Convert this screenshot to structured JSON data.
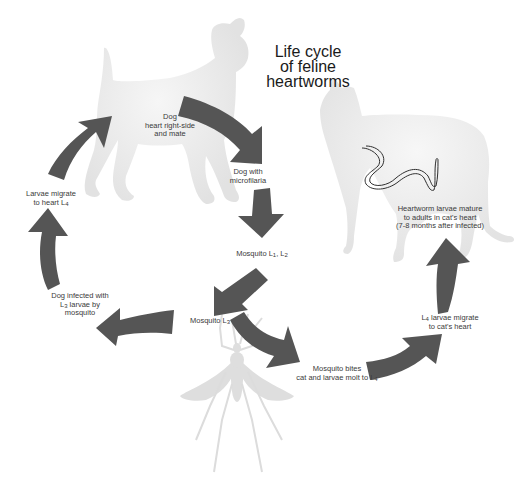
{
  "title": {
    "line1": "Life cycle",
    "line2": "of feline",
    "line3": "heartworms"
  },
  "colors": {
    "arrow": "#555555",
    "silhouette": "#e4e4e4",
    "background": "#ffffff",
    "text": "#3a3a3a"
  },
  "silhouettes": [
    {
      "name": "dog",
      "icon": "dog-silhouette-icon"
    },
    {
      "name": "cat",
      "icon": "cat-silhouette-icon"
    },
    {
      "name": "mosquito",
      "icon": "mosquito-silhouette-icon"
    },
    {
      "name": "heartworm",
      "icon": "worm-icon"
    }
  ],
  "stages": {
    "dog_heart": {
      "l1": "Dog",
      "l2": "heart right-side",
      "l3": "and mate"
    },
    "dog_microfilaria": {
      "l1": "Dog with",
      "l2": "microfilaria"
    },
    "mosquito_l1_l2": {
      "prefix": "Mosquito L",
      "s1": "1",
      "mid": ", L",
      "s2": "2"
    },
    "mosquito_l3": {
      "prefix": "Mosquito L",
      "s1": "3"
    },
    "mosquito_bites": {
      "l1": "Mosquito bites",
      "l2_prefix": "cat and larvae molt to L",
      "s1": "4"
    },
    "l4_migrate_cat": {
      "l1_prefix": "L",
      "s1": "4",
      "l1_suffix": " larvae migrate",
      "l2": "to cat's heart"
    },
    "heartworm_mature": {
      "l1": "Heartworm larvae mature",
      "l2": "to adults in cat's heart",
      "l3": "(7-8 months after infected)"
    },
    "dog_infected": {
      "l1": "Dog infected with",
      "l2_prefix": "L",
      "s1": "3",
      "l2_suffix": " larvae by",
      "l3": "mosquito"
    },
    "larvae_migrate_dog": {
      "l1": "Larvae migrate",
      "l2_prefix": "to heart L",
      "s1": "4"
    }
  },
  "flow": [
    "Dog heart right-side and mate -> Dog with microfilaria",
    "Dog with microfilaria -> Mosquito L1, L2",
    "Mosquito L1, L2 -> Mosquito L3",
    "Mosquito L3 -> Dog infected with L3 larvae by mosquito",
    "Dog infected -> Larvae migrate to heart L4",
    "Larvae migrate to heart L4 -> Dog heart right-side and mate",
    "Mosquito L3 -> Mosquito bites cat and larvae molt to L4",
    "Mosquito bites -> L4 larvae migrate to cat's heart",
    "L4 larvae migrate to cat's heart -> Heartworm larvae mature to adults in cat's heart"
  ]
}
